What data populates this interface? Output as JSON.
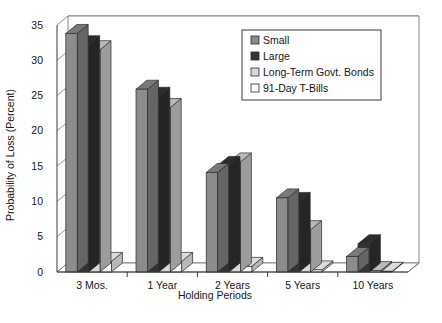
{
  "chart_data": {
    "type": "bar",
    "title": "",
    "xlabel": "Holding Periods",
    "ylabel": "Probability of Loss (Percent)",
    "categories": [
      "3 Mos.",
      "1 Year",
      "2 Years",
      "5 Years",
      "10 Years"
    ],
    "yticks": [
      0,
      5,
      10,
      15,
      20,
      25,
      30,
      35
    ],
    "ylim": [
      0,
      35
    ],
    "grid": true,
    "legend_position": "top-right",
    "style": "3d-clustered-column",
    "series": [
      {
        "name": "Small",
        "color": "#8c8c8c",
        "values": [
          33.8,
          25.9,
          14.1,
          10.5,
          2.2
        ]
      },
      {
        "name": "Large",
        "color": "#333333",
        "values": [
          32.2,
          24.9,
          15.1,
          10.0,
          4.0
        ]
      },
      {
        "name": "Long-Term Govt. Bonds",
        "color": "#d9d9d9",
        "values": [
          31.5,
          23.3,
          15.6,
          6.0,
          0.2
        ]
      },
      {
        "name": "91-Day T-Bills",
        "color": "#ffffff",
        "values": [
          1.5,
          1.5,
          0.8,
          0.3,
          0.1
        ]
      }
    ]
  },
  "axis": {
    "ylabel": "Probability of Loss (Percent)",
    "xlabel": "Holding Periods"
  },
  "legend": {
    "items": [
      {
        "label": "Small",
        "swatch": "#8c8c8c"
      },
      {
        "label": "Large",
        "swatch": "#333333"
      },
      {
        "label": "Long-Term Govt. Bonds",
        "swatch": "#d9d9d9"
      },
      {
        "label": "91-Day T-Bills",
        "swatch": "#ffffff"
      }
    ]
  },
  "caption": {
    "text": ""
  }
}
